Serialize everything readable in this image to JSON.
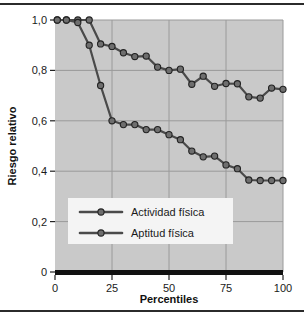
{
  "figure": {
    "background_color": "#ffffff",
    "plot_background_color": "#c9c9c9",
    "border_color": "#2b2b2b",
    "grid_color": "#9a9a9a",
    "series_color": "#4a4a4a",
    "marker_fill": "#6e6e6e",
    "marker_edge": "#222222"
  },
  "axes": {
    "x_title": "Percentiles",
    "y_title": "Riesgo relativo",
    "x_ticks": [
      "0",
      "25",
      "50",
      "75",
      "100"
    ],
    "y_ticks": [
      "0",
      "0,2",
      "0,4",
      "0,6",
      "0,8",
      "1,0"
    ]
  },
  "legend": {
    "items": [
      {
        "label": "Actividad física"
      },
      {
        "label": "Aptitud física"
      }
    ]
  },
  "chart_data": {
    "type": "line",
    "title": "",
    "xlabel": "Percentiles",
    "ylabel": "Riesgo relativo",
    "xlim": [
      0,
      100
    ],
    "ylim": [
      0,
      1.0
    ],
    "xticks": [
      0,
      25,
      50,
      75,
      100
    ],
    "yticks": [
      0,
      0.2,
      0.4,
      0.6,
      0.8,
      1.0
    ],
    "ytick_labels": [
      "0",
      "0,2",
      "0,4",
      "0,6",
      "0,8",
      "1,0"
    ],
    "grid": true,
    "legend_position": "lower-left-inside",
    "decimal_separator": ",",
    "series": [
      {
        "name": "Actividad física",
        "x": [
          1,
          5,
          10,
          15,
          20,
          25,
          30,
          35,
          40,
          45,
          50,
          55,
          60,
          65,
          70,
          75,
          80,
          85,
          90,
          95,
          100
        ],
        "values": [
          1.0,
          1.0,
          1.0,
          1.0,
          0.905,
          0.895,
          0.87,
          0.855,
          0.857,
          0.813,
          0.8,
          0.805,
          0.745,
          0.777,
          0.737,
          0.748,
          0.747,
          0.695,
          0.69,
          0.73,
          0.725
        ]
      },
      {
        "name": "Aptitud física",
        "x": [
          1,
          5,
          10,
          15,
          20,
          25,
          30,
          35,
          40,
          45,
          50,
          55,
          60,
          65,
          70,
          75,
          80,
          85,
          90,
          95,
          100
        ],
        "values": [
          1.0,
          1.0,
          0.99,
          0.9,
          0.74,
          0.6,
          0.585,
          0.585,
          0.565,
          0.565,
          0.545,
          0.525,
          0.48,
          0.457,
          0.46,
          0.425,
          0.41,
          0.365,
          0.363,
          0.363,
          0.363
        ]
      }
    ]
  }
}
